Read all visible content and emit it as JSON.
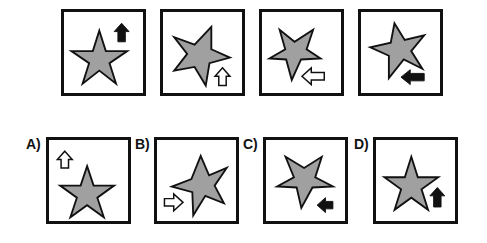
{
  "puzzle": {
    "type": "figure-sequence",
    "colors": {
      "star_fill": "#a0a0a0",
      "outline": "#111111",
      "arrow_solid": "#111111",
      "arrow_hollow": "#ffffff"
    },
    "sequence": [
      {
        "index": 1,
        "star_rotation": 0,
        "arrow": {
          "direction": "up",
          "style": "solid",
          "position": "top-right"
        }
      },
      {
        "index": 2,
        "star_rotation": 20,
        "arrow": {
          "direction": "up",
          "style": "hollow",
          "position": "bottom-right"
        }
      },
      {
        "index": 3,
        "star_rotation": 180,
        "arrow": {
          "direction": "left",
          "style": "hollow",
          "position": "bottom-right"
        }
      },
      {
        "index": 4,
        "star_rotation": 200,
        "arrow": {
          "direction": "left",
          "style": "solid",
          "position": "bottom-right"
        }
      }
    ],
    "options": [
      {
        "label": "A)",
        "star_rotation": 0,
        "arrow": {
          "direction": "up",
          "style": "hollow",
          "position": "top-left"
        }
      },
      {
        "label": "B)",
        "star_rotation": 20,
        "arrow": {
          "direction": "right",
          "style": "hollow",
          "position": "bottom-left"
        }
      },
      {
        "label": "C)",
        "star_rotation": 180,
        "arrow": {
          "direction": "left",
          "style": "solid",
          "position": "bottom-right"
        }
      },
      {
        "label": "D)",
        "star_rotation": 0,
        "arrow": {
          "direction": "up",
          "style": "solid",
          "position": "bottom-right"
        }
      }
    ]
  }
}
